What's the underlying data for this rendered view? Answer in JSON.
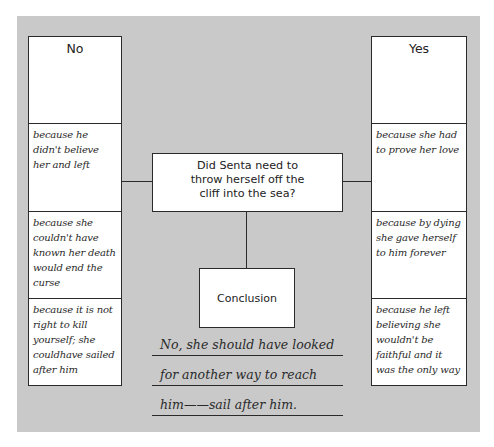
{
  "diagram": {
    "question": "Did Senta need to throw herself off the cliff into the sea?",
    "question_lines": [
      "Did Senta need to",
      "throw herself off the",
      "cliff into the sea?"
    ],
    "no_column": {
      "header": "No",
      "reasons": [
        "because he didn't believe her and left",
        "because she couldn't have known her death would end the curse",
        "because it is not right to kill yourself; she couldhave sailed after him"
      ]
    },
    "yes_column": {
      "header": "Yes",
      "reasons": [
        "because she had to prove her love",
        "because by dying she gave herself to him forever",
        "because he left believing she wouldn't be faithful and it was the only way"
      ]
    },
    "conclusion": {
      "label": "Conclusion",
      "answer_lines": [
        "No, she should have looked",
        "for another way to reach",
        "him——sail after him."
      ]
    }
  }
}
